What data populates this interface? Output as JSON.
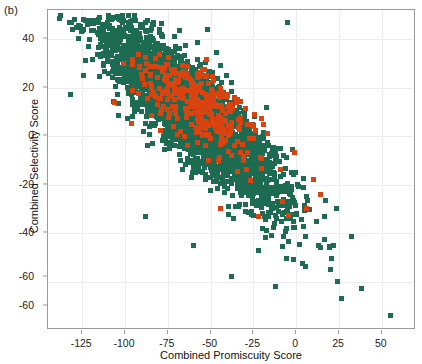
{
  "panel": {
    "label": "(b)"
  },
  "chart_data": {
    "type": "scatter",
    "title": "",
    "xlabel": "Combined Promiscuity Score",
    "ylabel": "Combined Selectivity Score",
    "xlim": [
      -145,
      70
    ],
    "ylim": [
      -80,
      52
    ],
    "xticks": [
      -125,
      -100,
      -75,
      -50,
      -25,
      0,
      25,
      50
    ],
    "xticklabels": [
      "-125",
      "-100",
      "-75",
      "-50",
      "-25",
      "0",
      "25",
      "50"
    ],
    "yticks": [
      40,
      20,
      0,
      -20,
      -40,
      -60,
      -60
    ],
    "yticklabels": [
      "40",
      "20",
      "0",
      "-20",
      "-40",
      "-60",
      "-60"
    ],
    "grid": true,
    "legend": "none",
    "marker": "square",
    "marker_size_px": 5,
    "series": [
      {
        "name": "all-compounds",
        "color": "#1d6b51",
        "n_points": 3000,
        "description": "Dense elongated cloud with strong negative correlation; spans x -140..60, y -75..50",
        "distribution": {
          "x_mean": -62,
          "x_sd": 28,
          "slope": -0.62,
          "intercept": -28,
          "residual_sd": 9.5
        }
      },
      {
        "name": "highlighted-subset",
        "color": "#d8430f",
        "n_points": 330,
        "description": "Orange subset concentrated in upper-middle of the cloud, x -110..0, y -35..32",
        "distribution": {
          "x_mean": -58,
          "x_sd": 20,
          "slope": -0.45,
          "intercept": -12,
          "residual_sd": 8.0
        }
      }
    ]
  }
}
